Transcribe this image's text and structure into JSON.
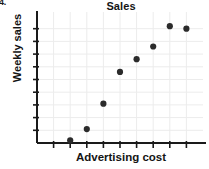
{
  "item_number": "4.",
  "chart_data": {
    "type": "scatter",
    "title": "Sales",
    "xlabel": "Advertising cost",
    "ylabel": "Weekly sales",
    "x": [
      2,
      3,
      4,
      5,
      6,
      7,
      8,
      9
    ],
    "y": [
      0.2,
      1.1,
      3.1,
      5.6,
      6.6,
      7.6,
      9.2,
      9.0
    ],
    "xlim": [
      0,
      10
    ],
    "ylim": [
      0,
      10
    ],
    "grid": true,
    "legend": false,
    "marker_color": "#2b2b2b",
    "axis_color": "#1a1a1a",
    "grid_color": "#ececec",
    "x_ticks": [
      1,
      2,
      3,
      4,
      5,
      6,
      7,
      8,
      9
    ],
    "y_ticks": [
      1,
      2,
      3,
      4,
      5,
      6,
      7,
      8,
      9
    ]
  }
}
